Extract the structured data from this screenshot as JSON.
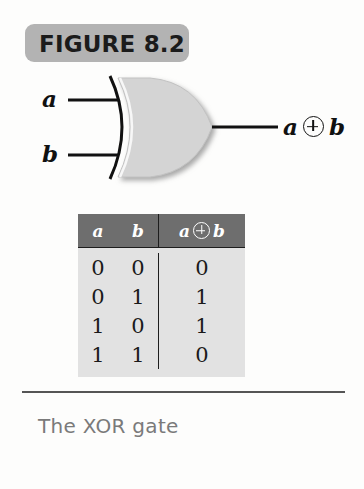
{
  "figure": {
    "banner_label": "FIGURE 8.2",
    "banner_color": "#b3b3b3",
    "caption": "The XOR gate"
  },
  "gate": {
    "type": "XOR",
    "inputs": [
      {
        "label": "a"
      },
      {
        "label": "b"
      }
    ],
    "output": {
      "left_operand": "a",
      "operator_icon": "xor-circle-plus-icon",
      "right_operand": "b",
      "text": "a ⊕ b"
    },
    "body_color": "#d4d4d4",
    "line_color": "#111111"
  },
  "truth_table": {
    "headers": {
      "a": "a",
      "b": "b",
      "out_left": "a",
      "out_right": "b"
    },
    "header_bg": "#6e6e6e",
    "body_bg": "#e2e2e2",
    "rows": [
      {
        "a": "0",
        "b": "0",
        "out": "0"
      },
      {
        "a": "0",
        "b": "1",
        "out": "1"
      },
      {
        "a": "1",
        "b": "0",
        "out": "1"
      },
      {
        "a": "1",
        "b": "1",
        "out": "0"
      }
    ]
  }
}
